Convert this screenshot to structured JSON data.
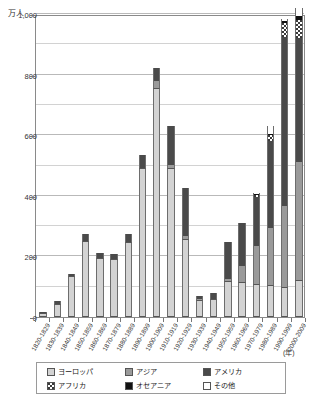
{
  "chart_data": {
    "type": "bar",
    "stacked": true,
    "title": "",
    "subtitle": "",
    "xlabel": "(年)",
    "ylabel": "万人",
    "ylim": [
      0,
      1000
    ],
    "yticks": [
      0,
      200,
      400,
      600,
      800,
      1000
    ],
    "ytick_labels": [
      "0",
      "200",
      "400",
      "600",
      "800",
      "1,000"
    ],
    "minor_gridlines": [
      100,
      300,
      500,
      700,
      900
    ],
    "grid": true,
    "legend_position": "bottom",
    "categories": [
      "1820-1829",
      "1830-1839",
      "1840-1849",
      "1850-1859",
      "1860-1869",
      "1870-1879",
      "1880-1889",
      "1890-1899",
      "1900-1909",
      "1910-1919",
      "1920-1929",
      "1930-1939",
      "1940-1949",
      "1950-1959",
      "1960-1969",
      "1970-1979",
      "1980-1989",
      "1990-1999",
      "2000-2009"
    ],
    "series": [
      {
        "name": "ヨーロッパ",
        "key": "europe",
        "color": "#d3d3d3",
        "values": [
          13,
          44,
          134,
          251,
          195,
          193,
          248,
          492,
          755,
          492,
          258,
          56,
          59,
          118,
          117,
          110,
          105,
          100,
          122
        ]
      },
      {
        "name": "アジア",
        "key": "asia",
        "color": "#9a9a9a",
        "values": [
          0,
          0,
          0,
          0,
          0,
          0,
          0,
          0,
          25,
          10,
          8,
          2,
          2,
          8,
          53,
          125,
          190,
          265,
          390
        ]
      },
      {
        "name": "アメリカ",
        "key": "america",
        "color": "#4a4a4a",
        "values": [
          3,
          8,
          8,
          22,
          15,
          16,
          25,
          42,
          42,
          130,
          160,
          12,
          17,
          122,
          140,
          162,
          285,
          560,
          410
        ]
      },
      {
        "name": "アフリカ",
        "key": "africa",
        "color": "#ffffff",
        "values": [
          0,
          0,
          0,
          0,
          0,
          0,
          0,
          0,
          0,
          0,
          0,
          0,
          0,
          0,
          0,
          5,
          20,
          45,
          60
        ]
      },
      {
        "name": "オセアニア",
        "key": "oceania",
        "color": "#111111",
        "values": [
          0,
          0,
          0,
          0,
          0,
          0,
          0,
          0,
          0,
          0,
          0,
          0,
          0,
          0,
          0,
          3,
          5,
          8,
          10
        ]
      },
      {
        "name": "その他",
        "key": "other",
        "color": "#ffffff",
        "values": [
          0,
          0,
          0,
          0,
          0,
          0,
          0,
          0,
          0,
          0,
          0,
          0,
          0,
          0,
          0,
          4,
          25,
          7,
          28
        ]
      }
    ],
    "totals": [
      16,
      52,
      142,
      273,
      210,
      209,
      273,
      534,
      822,
      632,
      426,
      70,
      78,
      248,
      310,
      409,
      630,
      985,
      1020
    ]
  },
  "axis": {
    "y_unit": "万人",
    "x_unit": "(年)"
  },
  "legend": {
    "items": [
      {
        "label": "ヨーロッパ",
        "swatch": "europe-swatch"
      },
      {
        "label": "アジア",
        "swatch": "asia-swatch"
      },
      {
        "label": "アメリカ",
        "swatch": "america-swatch"
      },
      {
        "label": "アフリカ",
        "swatch": "africa-swatch"
      },
      {
        "label": "オセアニア",
        "swatch": "oceania-swatch"
      },
      {
        "label": "その他",
        "swatch": "other-swatch"
      }
    ]
  }
}
